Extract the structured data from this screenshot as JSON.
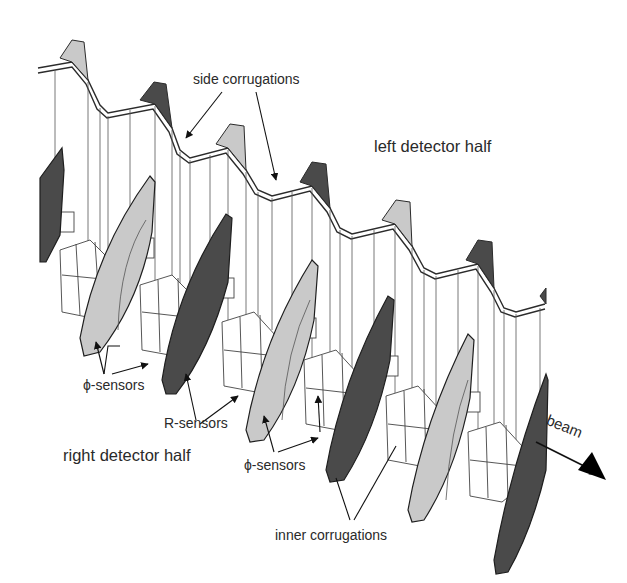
{
  "figure": {
    "colors": {
      "background": "#ffffff",
      "outline": "#2b2b2b",
      "foil_face": "#ffffff",
      "phi_sensor": "#c9c9c9",
      "r_sensor": "#4a4a4a",
      "arrow": "#111111"
    }
  },
  "labels": {
    "side_corrugations": "side corrugations",
    "left_detector_half": "left detector half",
    "phi_sensors_1": "ϕ-sensors",
    "r_sensors": "R-sensors",
    "right_detector_half": "right detector half",
    "phi_sensors_2": "ϕ-sensors",
    "inner_corrugations": "inner corrugations",
    "beam": "beam"
  }
}
